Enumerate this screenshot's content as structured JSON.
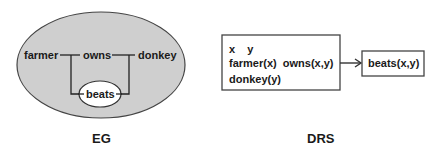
{
  "eg": {
    "caption": "EG",
    "nodes": {
      "farmer": "farmer",
      "owns": "owns",
      "donkey": "donkey",
      "beats": "beats"
    },
    "colors": {
      "outer_fill": "#cfcfcf",
      "inner_fill": "#ffffff",
      "stroke": "#333333"
    }
  },
  "drs": {
    "caption": "DRS",
    "main_box": {
      "referents": "x    y",
      "conditions": [
        "farmer(x)  owns(x,y)",
        "donkey(y)"
      ]
    },
    "consequent_box": {
      "condition": "beats(x,y)"
    }
  }
}
